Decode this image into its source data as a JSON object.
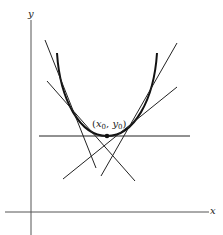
{
  "diagram": {
    "axes": {
      "x_label": "x",
      "y_label": "y"
    },
    "point": {
      "var_x": "x",
      "sub_x": "0",
      "var_y": "y",
      "sub_y": "0",
      "open": "(",
      "comma": ", ",
      "close": ")"
    },
    "curve": "convex parabola-like curve with vertex at (x0, y0)",
    "tangent_lines_count": 5,
    "colors": {
      "stroke": "#222222",
      "background": "#ffffff"
    }
  }
}
